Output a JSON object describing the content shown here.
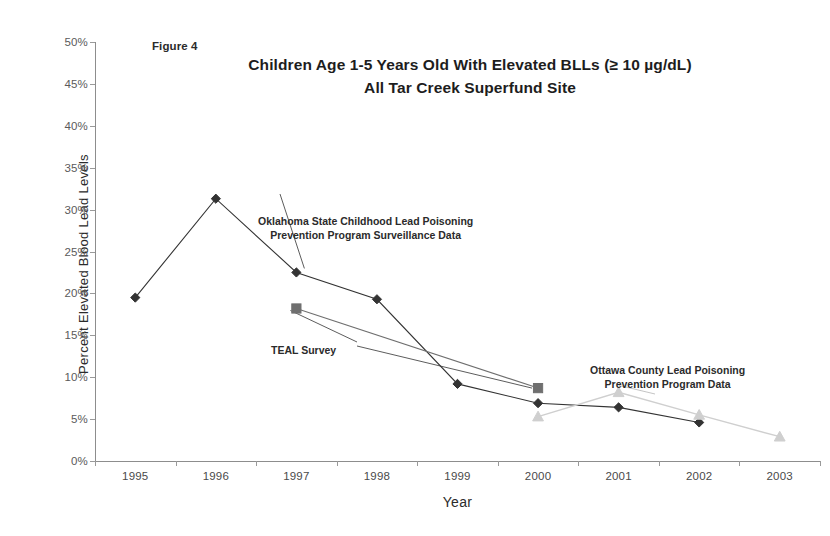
{
  "figure": {
    "label": "Figure 4",
    "title_line1": "Children Age 1-5 Years Old With Elevated BLLs (≥ 10 µg/dL)",
    "title_line2": "All Tar Creek Superfund Site"
  },
  "annotations": {
    "oklahoma": "Oklahoma State Childhood Lead Poisoning\nPrevention Program Surveillance Data",
    "oklahoma_line1": "Oklahoma State Childhood Lead Poisoning",
    "oklahoma_line2": "Prevention Program Surveillance Data",
    "teal": "TEAL Survey",
    "ottawa_line1": "Ottawa County Lead Poisoning",
    "ottawa_line2": "Prevention Program Data"
  },
  "colors": {
    "series_oklahoma": "#333333",
    "series_teal": "#6f6f6f",
    "series_ottawa": "#cfcfcf",
    "axis": "#8d8d8d",
    "text": "#1d1d1d",
    "background": "#ffffff"
  },
  "chart_data": {
    "type": "line",
    "xlabel": "Year",
    "ylabel": "Percent Elevated Blood Lead Levels",
    "categories": [
      "1995",
      "1996",
      "1997",
      "1998",
      "1999",
      "2000",
      "2001",
      "2002",
      "2003"
    ],
    "x": [
      1995,
      1996,
      1997,
      1998,
      1999,
      2000,
      2001,
      2002,
      2003
    ],
    "ylim": [
      0,
      50
    ],
    "yticks": [
      0,
      5,
      10,
      15,
      20,
      25,
      30,
      35,
      40,
      45,
      50
    ],
    "ytick_labels": [
      "0%",
      "5%",
      "10%",
      "15%",
      "20%",
      "25%",
      "30%",
      "35%",
      "40%",
      "45%",
      "50%"
    ],
    "y_unit": "percent",
    "grid": false,
    "legend": "annotations-inline",
    "series": [
      {
        "name": "Oklahoma State Childhood Lead Poisoning Prevention Program Surveillance Data",
        "short_name": "Oklahoma State",
        "marker": "diamond",
        "color": "#333333",
        "x": [
          1995,
          1996,
          1997,
          1998,
          1999,
          2000,
          2001,
          2002
        ],
        "values": [
          19.5,
          31.3,
          22.5,
          19.3,
          9.2,
          6.9,
          6.4,
          4.6
        ]
      },
      {
        "name": "TEAL Survey",
        "short_name": "TEAL Survey",
        "marker": "square",
        "color": "#6f6f6f",
        "x": [
          1997,
          2000
        ],
        "values": [
          18.2,
          8.7
        ]
      },
      {
        "name": "Ottawa County Lead Poisoning Prevention Program Data",
        "short_name": "Ottawa County",
        "marker": "triangle",
        "color": "#cfcfcf",
        "x": [
          2000,
          2001,
          2002,
          2003
        ],
        "values": [
          5.3,
          8.2,
          5.5,
          2.9
        ]
      }
    ]
  }
}
